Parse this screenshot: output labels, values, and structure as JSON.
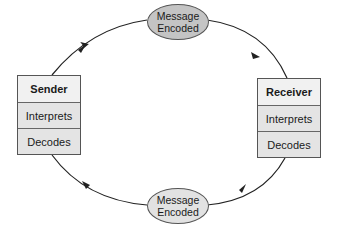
{
  "diagram": {
    "type": "communication-cycle",
    "sender": {
      "title": "Sender",
      "rows": [
        "Interprets",
        "Decodes"
      ]
    },
    "receiver": {
      "title": "Receiver",
      "rows": [
        "Interprets",
        "Decodes"
      ]
    },
    "top_node": {
      "line1": "Message",
      "line2": "Encoded"
    },
    "bottom_node": {
      "line1": "Message",
      "line2": "Encoded"
    },
    "edges": [
      {
        "from": "Sender",
        "to": "Message Encoded (top)"
      },
      {
        "from": "Message Encoded (top)",
        "to": "Receiver"
      },
      {
        "from": "Receiver",
        "to": "Message Encoded (bottom)"
      },
      {
        "from": "Message Encoded (bottom)",
        "to": "Sender"
      }
    ],
    "colors": {
      "top_ellipse_fill": "#c4c4c4",
      "bottom_ellipse_fill": "#e2e2e2",
      "box_fill": "#e9e9e9",
      "line": "#222222"
    }
  }
}
